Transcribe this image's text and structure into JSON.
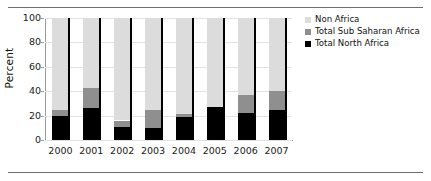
{
  "chart_data": {
    "type": "bar",
    "stacked": true,
    "title": "",
    "subtitle": "",
    "xlabel": "",
    "ylabel": "Percent",
    "categories": [
      "2000",
      "2001",
      "2002",
      "2003",
      "2004",
      "2005",
      "2006",
      "2007"
    ],
    "ylim": [
      0,
      100
    ],
    "yticks": [
      0,
      20,
      40,
      60,
      80,
      100
    ],
    "ytick_labels": [
      "0",
      "20",
      "40",
      "60",
      "80",
      "100"
    ],
    "grid": true,
    "grid_axis": "y",
    "legend_position": "right",
    "series": [
      {
        "name": "Total North Africa",
        "color": "#000000",
        "values": [
          20,
          26,
          11,
          10,
          19,
          27,
          22,
          25
        ]
      },
      {
        "name": "Total Sub Saharan Africa",
        "color": "#8f8f8f",
        "values": [
          5,
          17,
          5,
          15,
          2,
          0,
          15,
          15
        ]
      },
      {
        "name": "Non Africa",
        "color": "#dcdcdc",
        "values": [
          75,
          57,
          84,
          75,
          79,
          73,
          63,
          60
        ]
      }
    ],
    "legend": [
      {
        "label": "Non Africa",
        "color": "#dcdcdc"
      },
      {
        "label": "Total Sub Saharan Africa",
        "color": "#8f8f8f"
      },
      {
        "label": "Total North Africa",
        "color": "#000000"
      }
    ]
  },
  "colors": {
    "background": "#ffffff",
    "axis": "#9a9a9a",
    "grid": "#e3e3e3",
    "rule": "#6d6d6d",
    "text": "#111111"
  }
}
